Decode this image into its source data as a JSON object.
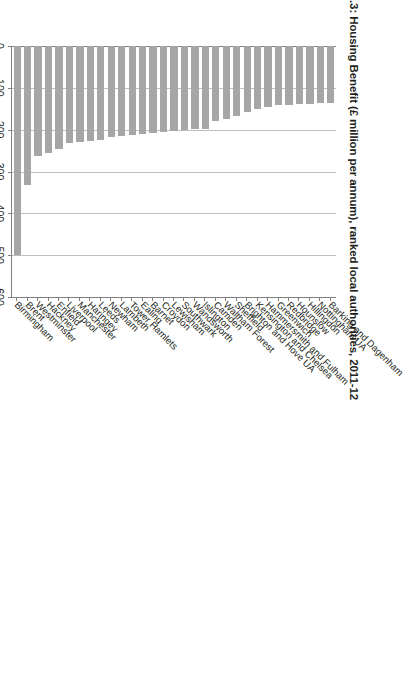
{
  "figure": {
    "title": ".3: Housing Benefit (£ million per annum), ranked local authorities, 2011-12",
    "bar_color": "#a6a6a6",
    "gridline_color": "#bfbfbf",
    "axis_color": "#808080"
  },
  "chart_data": {
    "type": "bar",
    "orientation": "horizontal",
    "title": ".3: Housing Benefit (£ million per annum), ranked local authorities, 2011-12",
    "xlabel": "",
    "ylabel": "",
    "xlim": [
      0,
      600
    ],
    "xticks": [
      0,
      100,
      200,
      300,
      400,
      500,
      600
    ],
    "xtick_labels": [
      "0",
      "100",
      "200",
      "300",
      "400",
      "500",
      "600"
    ],
    "grid": true,
    "legend": false,
    "units": "£ million per annum",
    "period": "2011-12",
    "categories": [
      "Birmingham",
      "Brent",
      "Westminster",
      "Hackney",
      "Enfield",
      "Liverpool",
      "Manchester",
      "Haringey",
      "Leeds",
      "Newham",
      "Lambeth",
      "Tower Hamlets",
      "Ealing",
      "Barnet",
      "Croydon",
      "Lewisham",
      "Southwark",
      "Wandsworth",
      "Islington",
      "Camden",
      "Waltham Forest",
      "Sheffield",
      "Brighton and Hove UA",
      "Kensington and Chelsea",
      "Hammersmith and Fulham",
      "Greenwich",
      "Redbridge",
      "Hounslow",
      "Hillingdon",
      "Nottingham UA",
      "Barking and Dagenham"
    ],
    "values": [
      499,
      332,
      262,
      256,
      247,
      231,
      229,
      228,
      225,
      217,
      216,
      213,
      210,
      208,
      206,
      203,
      201,
      199,
      198,
      180,
      174,
      168,
      158,
      150,
      145,
      142,
      140,
      139,
      138,
      137,
      136
    ]
  }
}
